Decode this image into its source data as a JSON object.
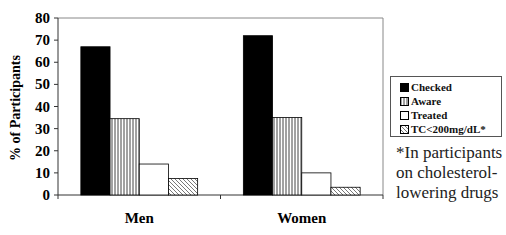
{
  "chart_data": {
    "type": "bar",
    "title": "",
    "xlabel": "",
    "ylabel": "% of Participants",
    "ylim": [
      0,
      80
    ],
    "yticks": [
      0,
      10,
      20,
      30,
      40,
      50,
      60,
      70,
      80
    ],
    "categories": [
      "Men",
      "Women"
    ],
    "series": [
      {
        "name": "Checked",
        "pattern": "solid-black",
        "values": [
          67,
          72
        ]
      },
      {
        "name": "Aware",
        "pattern": "vertical-lines",
        "values": [
          34.5,
          35
        ]
      },
      {
        "name": "Treated",
        "pattern": "white",
        "values": [
          14,
          10
        ]
      },
      {
        "name": "TC<200mg/dL*",
        "pattern": "diagonal-lines",
        "values": [
          7.5,
          3.5
        ]
      }
    ],
    "legend_position": "right",
    "grid": false,
    "annotation": "*In participants on cholesterol-lowering drugs"
  },
  "legend": {
    "items": [
      "Checked",
      "Aware",
      "Treated",
      "TC<200mg/dL*"
    ]
  },
  "footnote": "*In participants on cholesterol-lowering drugs"
}
